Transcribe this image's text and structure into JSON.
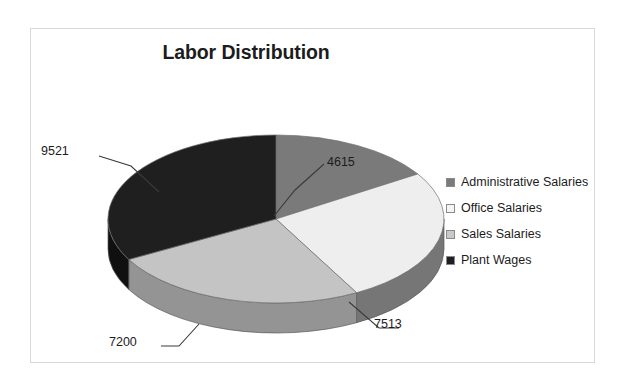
{
  "chart_data": {
    "type": "pie",
    "title": "Labor Distribution",
    "categories": [
      "Administrative Salaries",
      "Office Salaries",
      "Sales Salaries",
      "Plant Wages"
    ],
    "values": [
      4615,
      7513,
      7200,
      9521
    ],
    "labels": [
      "4615",
      "7513",
      "7200",
      "9521"
    ],
    "total": 28849,
    "percentages": [
      16.0,
      26.0,
      25.0,
      33.0
    ],
    "colors": [
      "#7a7a7a",
      "#eeeeee",
      "#c4c4c4",
      "#1f1f1f"
    ],
    "side_colors": [
      "#5c5c5c",
      "#767676",
      "#949494",
      "#101010"
    ],
    "three_d": true,
    "legend_position": "right",
    "grid": false,
    "xlabel": "",
    "ylabel": ""
  },
  "frame": {
    "border_color": "#d9d9d9"
  },
  "callouts": {
    "administrative": "4615",
    "office": "7513",
    "sales": "7200",
    "plant": "9521"
  },
  "legend": {
    "items": [
      {
        "label": "Administrative Salaries",
        "color": "#7a7a7a"
      },
      {
        "label": "Office Salaries",
        "color": "#f4f4f4"
      },
      {
        "label": "Sales Salaries",
        "color": "#c9c9c9"
      },
      {
        "label": "Plant Wages",
        "color": "#1f1f1f"
      }
    ]
  }
}
